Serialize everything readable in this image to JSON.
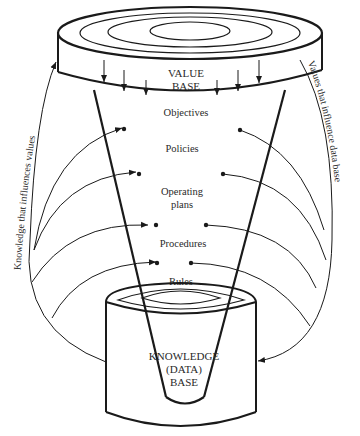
{
  "diagram": {
    "top_cylinder": {
      "label_line1": "VALUE",
      "label_line2": "BASE"
    },
    "funnel_levels": [
      "Objectives",
      "Policies",
      "Operating",
      "plans",
      "Procedures",
      "Rules"
    ],
    "bottom_cylinder": {
      "label_line1": "KNOWLEDGE",
      "label_line2": "(DATA)",
      "label_line3": "BASE"
    },
    "left_arc_label": "Knowledge that influences values",
    "right_arc_label": "Values that influence data base",
    "colors": {
      "ink": "#1a1a1a",
      "background": "#ffffff"
    }
  }
}
